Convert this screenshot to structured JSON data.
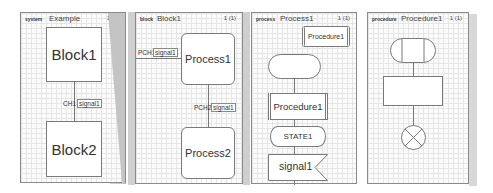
{
  "panels": [
    {
      "kind": "system",
      "name": "Example",
      "page": "1 (1)",
      "blocks": [
        "Block1",
        "Block2"
      ],
      "channel": {
        "name": "CH1",
        "signal": "signal1"
      }
    },
    {
      "kind": "block",
      "name": "Block1",
      "page": "1 (1)",
      "processes": [
        "Process1",
        "Process2"
      ],
      "channels": [
        {
          "name": "PCH1",
          "signal": "signal1"
        },
        {
          "name": "PCH2",
          "signal": "signal1"
        }
      ]
    },
    {
      "kind": "process",
      "name": "Process1",
      "page": "1 (1)",
      "procedure_ref": "Procedure1",
      "procedure_call": "Procedure1",
      "state": "STATE1",
      "input_signal": "signal1"
    },
    {
      "kind": "procedure",
      "name": "Procedure1",
      "page": "1 (1)"
    }
  ],
  "colors": {
    "border": "#8a8a8a",
    "grid": "#e6e6e6",
    "shadow": "#c8c8c8"
  }
}
